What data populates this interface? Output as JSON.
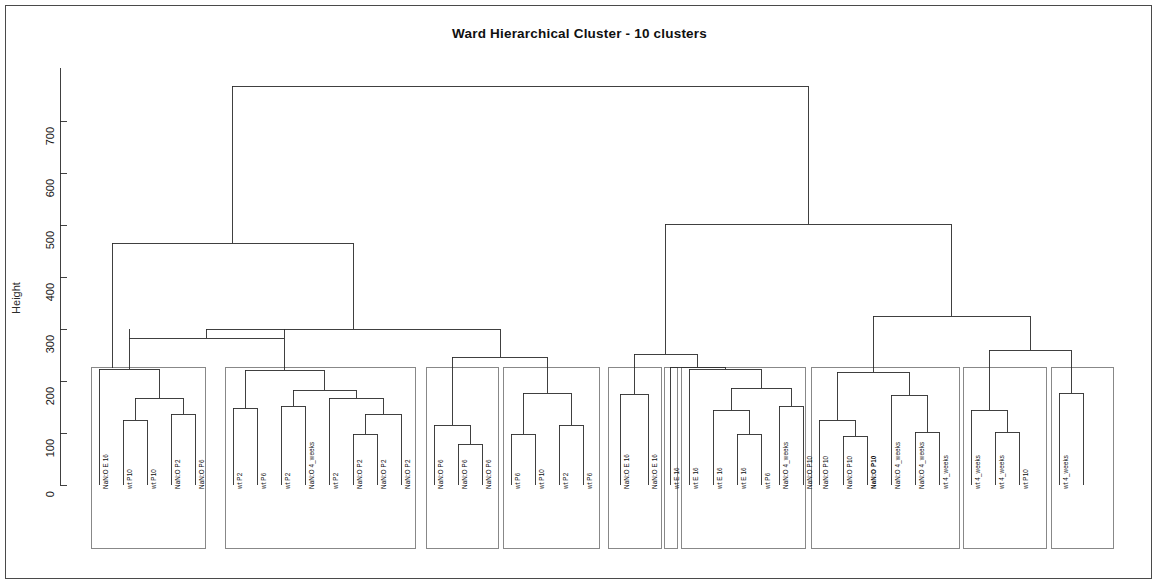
{
  "chart_data": {
    "type": "dendrogram",
    "title": "Ward Hierarchical Cluster - 10 clusters",
    "xlabel": "",
    "ylabel": "Height",
    "ylim": [
      0,
      790
    ],
    "yticks": [
      0,
      100,
      200,
      300,
      400,
      500,
      600,
      700
    ],
    "ytick_labels": [
      "0",
      "100",
      "200",
      "300",
      "400",
      "500",
      "600",
      "700"
    ],
    "grid": false,
    "n_clusters": 10,
    "n_leaves": 41,
    "leaf_labels": [
      "NaN:O E 16",
      "wt P10",
      "wt P10",
      "NaN:O P2",
      "NaN:O P6",
      "wt P2",
      "wt P6",
      "wt P2",
      "NaN:O 4_weeks",
      "wt P2",
      "NaN:O P2",
      "NaN:O P2",
      "NaN:O P2",
      "NaN:O P6",
      "NaN:O P6",
      "NaN:O P6",
      "wt P6",
      "wt P10",
      "wt P2",
      "wt P6",
      "NaN:O E 16",
      "NaN:O E 16",
      "wt E 16",
      "wt E 16",
      "wt E 16",
      "wt E 16",
      "wt P6",
      "NaN:O 4_weeks",
      "NaN:O P10",
      "NaN:O P10",
      "NaN:O P10",
      "NaN:O P10",
      "NaN:O 4_weeks",
      "NaN:O 4_weeks",
      "wt 4_weeks",
      "wt 4_weeks",
      "wt 4_weeks",
      "wt P10",
      "wt 4_weeks"
    ],
    "bold_leaf_labels": [
      "NaN:O P10"
    ],
    "clusters": [
      {
        "id": 1,
        "members": [
          "NaN:O E 16",
          "wt P10",
          "wt P10",
          "NaN:O P2",
          "NaN:O P6"
        ],
        "merge_height": 238
      },
      {
        "id": 2,
        "members": [
          "wt P2",
          "wt P6",
          "wt P2",
          "NaN:O 4_weeks",
          "wt P2",
          "NaN:O P2",
          "NaN:O P2",
          "NaN:O P2"
        ],
        "merge_height": 222
      },
      {
        "id": 3,
        "members": [
          "NaN:O P6",
          "NaN:O P6",
          "NaN:O P6"
        ],
        "merge_height": 152
      },
      {
        "id": 4,
        "members": [
          "wt P6",
          "wt P10",
          "wt P2",
          "wt P6"
        ],
        "merge_height": 178
      },
      {
        "id": 5,
        "members": [
          "NaN:O E 16",
          "NaN:O E 16"
        ],
        "merge_height": 176
      },
      {
        "id": 6,
        "members": [
          "wt E 16"
        ],
        "merge_height": 0
      },
      {
        "id": 7,
        "members": [
          "wt E 16",
          "wt E 16",
          "wt E 16",
          "wt P6",
          "NaN:O 4_weeks"
        ],
        "merge_height": 238
      },
      {
        "id": 8,
        "members": [
          "NaN:O P10",
          "NaN:O P10",
          "NaN:O P10",
          "NaN:O P10",
          "NaN:O 4_weeks",
          "NaN:O 4_weeks"
        ],
        "merge_height": 232
      },
      {
        "id": 9,
        "members": [
          "wt 4_weeks",
          "wt 4_weeks",
          "wt 4_weeks"
        ],
        "merge_height": 178
      },
      {
        "id": 10,
        "members": [
          "wt P10",
          "wt 4_weeks"
        ],
        "merge_height": 218
      }
    ],
    "root_height": 770,
    "left_branch_height": 463,
    "right_branch_height": 505,
    "notable_heights": [
      770,
      505,
      463,
      342,
      331,
      265,
      252,
      238,
      232,
      222,
      218,
      178,
      176,
      152
    ]
  },
  "axis": {
    "ylabel": "Height",
    "tick_labels": [
      "700",
      "600",
      "500",
      "400",
      "300",
      "200",
      "100",
      "0"
    ]
  },
  "title": "Ward Hierarchical Cluster - 10 clusters"
}
